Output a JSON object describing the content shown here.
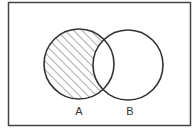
{
  "diagram": {
    "type": "venn",
    "frame": {
      "x": 8,
      "y": 2,
      "width": 183,
      "height": 124,
      "stroke": "#444444"
    },
    "sets": [
      {
        "name": "A",
        "label": "A",
        "cx": 79,
        "cy": 64,
        "r": 35
      },
      {
        "name": "B",
        "label": "B",
        "cx": 128,
        "cy": 65,
        "r": 35
      }
    ],
    "shaded_region": "A - B",
    "hatch": {
      "direction": "diagonal-up-right",
      "spacing": 6,
      "color": "#555555"
    },
    "stroke_color": "#333333"
  }
}
